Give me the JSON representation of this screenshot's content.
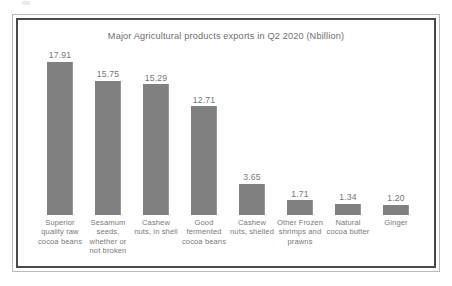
{
  "figure": {
    "title": "Major Agricultural products exports in Q2 2020 (Nbillion)",
    "bar_color": "#808080",
    "frame_color": "#4a4a4a",
    "text_color": "#7a7a7a"
  },
  "chart_data": {
    "type": "bar",
    "title": "Major Agricultural products exports in Q2 2020 (Nbillion)",
    "xlabel": "",
    "ylabel": "",
    "ylim": [
      0,
      17.91
    ],
    "grid": false,
    "legend": false,
    "value_labels": true,
    "categories": [
      "Superior quality raw cocoa beans",
      "Sesamum seeds, whether or not broken",
      "Cashew nuts, in shell",
      "Good fermented cocoa beans",
      "Cashew nuts, shelled",
      "Other Frozen shrimps and prawns",
      "Natural cocoa butter",
      "Ginger"
    ],
    "values": [
      17.91,
      15.75,
      15.29,
      12.71,
      3.65,
      1.71,
      1.34,
      1.2
    ],
    "value_labels_text": [
      "17.91",
      "15.75",
      "15.29",
      "12.71",
      "3.65",
      "1.71",
      "1.34",
      "1.20"
    ]
  }
}
